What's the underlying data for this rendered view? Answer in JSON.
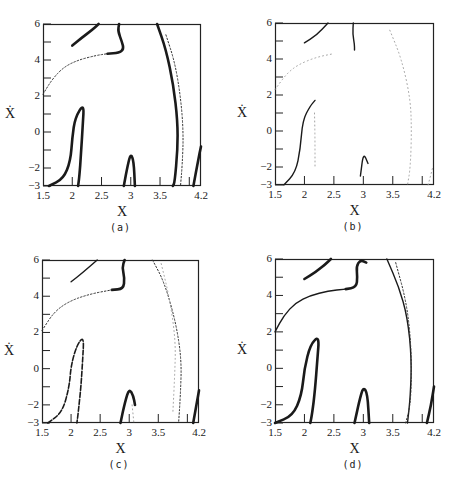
{
  "chart_data": [
    {
      "type": "scatter",
      "panel": "a",
      "caption": "(a)",
      "xlabel": "X",
      "ylabel": "Ẋ",
      "xlim": [
        1.5,
        4.2
      ],
      "ylim": [
        -3,
        6
      ],
      "xticks": [
        "1.5",
        "2",
        "2.5",
        "3",
        "3.5",
        "4.2"
      ],
      "yticks": [
        "6",
        "4",
        "2",
        "0",
        "−2",
        "−3"
      ],
      "grid": false,
      "series": [
        {
          "name": "upper-left branch",
          "style": "thick",
          "points": [
            [
              2.0,
              4.8
            ],
            [
              2.15,
              5.2
            ],
            [
              2.35,
              5.7
            ],
            [
              2.45,
              6.0
            ]
          ]
        },
        {
          "name": "upper hook",
          "style": "thick",
          "points": [
            [
              2.8,
              6.0
            ],
            [
              2.78,
              5.6
            ],
            [
              2.85,
              5.0
            ],
            [
              2.88,
              4.6
            ],
            [
              2.8,
              4.4
            ],
            [
              2.6,
              4.35
            ]
          ]
        },
        {
          "name": "dotted arc",
          "style": "dotted",
          "points": [
            [
              1.5,
              2.1
            ],
            [
              1.65,
              2.9
            ],
            [
              1.85,
              3.6
            ],
            [
              2.1,
              4.0
            ],
            [
              2.4,
              4.25
            ],
            [
              2.6,
              4.35
            ]
          ]
        },
        {
          "name": "left tongue",
          "style": "thick",
          "points": [
            [
              1.6,
              -3.0
            ],
            [
              1.85,
              -2.6
            ],
            [
              1.97,
              -1.6
            ],
            [
              2.0,
              -0.3
            ],
            [
              2.05,
              0.8
            ],
            [
              2.2,
              1.6
            ],
            [
              2.18,
              0.4
            ],
            [
              2.15,
              -1.2
            ],
            [
              2.12,
              -2.5
            ],
            [
              2.1,
              -3.0
            ]
          ]
        },
        {
          "name": "middle tongue",
          "style": "thick",
          "points": [
            [
              2.88,
              -3.0
            ],
            [
              2.95,
              -1.8
            ],
            [
              3.0,
              -1.2
            ],
            [
              3.05,
              -1.6
            ],
            [
              3.07,
              -3.0
            ]
          ]
        },
        {
          "name": "outer arc",
          "style": "thick",
          "points": [
            [
              3.45,
              6.0
            ],
            [
              3.6,
              4.6
            ],
            [
              3.73,
              2.6
            ],
            [
              3.8,
              0.6
            ],
            [
              3.8,
              -1.0
            ],
            [
              3.75,
              -2.8
            ],
            [
              3.72,
              -3.0
            ]
          ]
        },
        {
          "name": "inner dotted arc",
          "style": "dotted",
          "points": [
            [
              3.6,
              5.4
            ],
            [
              3.75,
              3.9
            ],
            [
              3.85,
              2.0
            ],
            [
              3.9,
              0.0
            ],
            [
              3.88,
              -1.8
            ],
            [
              3.85,
              -3.0
            ]
          ]
        },
        {
          "name": "right edge",
          "style": "thick",
          "points": [
            [
              4.07,
              -3.0
            ],
            [
              4.15,
              -1.6
            ],
            [
              4.2,
              -0.8
            ]
          ]
        }
      ]
    },
    {
      "type": "scatter",
      "panel": "b",
      "caption": "(b)",
      "xlabel": "X",
      "ylabel": "Ẋ",
      "xlim": [
        1.5,
        4.2
      ],
      "ylim": [
        -3,
        6
      ],
      "xticks": [
        "1.5",
        "2",
        "2.5",
        "3",
        "3.5",
        "4.2"
      ],
      "yticks": [
        "6",
        "4",
        "2",
        "0",
        "−2",
        "−3"
      ],
      "grid": false,
      "series": [
        {
          "name": "upper-left branch",
          "style": "medium",
          "points": [
            [
              2.0,
              4.9
            ],
            [
              2.2,
              5.3
            ],
            [
              2.4,
              6.0
            ]
          ]
        },
        {
          "name": "upper hook",
          "style": "medium",
          "points": [
            [
              2.83,
              6.0
            ],
            [
              2.82,
              5.4
            ],
            [
              2.85,
              4.8
            ],
            [
              2.85,
              4.5
            ]
          ]
        },
        {
          "name": "dotted arc",
          "style": "faint",
          "points": [
            [
              1.5,
              2.3
            ],
            [
              1.7,
              3.2
            ],
            [
              1.9,
              3.7
            ],
            [
              2.2,
              4.1
            ],
            [
              2.5,
              4.3
            ]
          ]
        },
        {
          "name": "left tongue",
          "style": "medium",
          "points": [
            [
              1.65,
              -3.0
            ],
            [
              1.85,
              -2.3
            ],
            [
              1.93,
              -1.0
            ],
            [
              1.97,
              0.6
            ],
            [
              2.1,
              1.4
            ],
            [
              2.18,
              1.7
            ]
          ]
        },
        {
          "name": "left tongue return",
          "style": "faint",
          "points": [
            [
              2.17,
              1.0
            ],
            [
              2.18,
              -0.5
            ],
            [
              2.18,
              -2.0
            ]
          ]
        },
        {
          "name": "middle tongue",
          "style": "medium",
          "points": [
            [
              2.95,
              -2.5
            ],
            [
              3.0,
              -1.2
            ],
            [
              3.08,
              -1.8
            ]
          ]
        },
        {
          "name": "right dotted arc",
          "style": "faint",
          "points": [
            [
              3.45,
              5.6
            ],
            [
              3.65,
              4.0
            ],
            [
              3.8,
              1.8
            ],
            [
              3.82,
              0.0
            ],
            [
              3.8,
              -2.0
            ],
            [
              3.75,
              -3.0
            ]
          ]
        },
        {
          "name": "right edge",
          "style": "faint",
          "points": [
            [
              4.1,
              -3.0
            ],
            [
              4.18,
              -2.0
            ]
          ]
        }
      ]
    },
    {
      "type": "scatter",
      "panel": "c",
      "caption": "(c)",
      "xlabel": "X",
      "ylabel": "Ẋ",
      "xlim": [
        1.5,
        4.2
      ],
      "ylim": [
        -3,
        6
      ],
      "xticks": [
        "1.5",
        "2",
        "2.5",
        "3",
        "3.5",
        "4.2"
      ],
      "yticks": [
        "6",
        "4",
        "2",
        "0",
        "−2",
        "−3"
      ],
      "grid": false,
      "series": [
        {
          "name": "upper-left branch",
          "style": "medium",
          "points": [
            [
              2.0,
              4.8
            ],
            [
              2.2,
              5.3
            ],
            [
              2.45,
              6.0
            ]
          ]
        },
        {
          "name": "upper hook",
          "style": "thick",
          "points": [
            [
              2.92,
              6.0
            ],
            [
              2.88,
              5.6
            ],
            [
              2.92,
              5.0
            ],
            [
              2.9,
              4.4
            ],
            [
              2.7,
              4.35
            ]
          ]
        },
        {
          "name": "dotted arc",
          "style": "dotted",
          "points": [
            [
              1.5,
              2.1
            ],
            [
              1.7,
              3.1
            ],
            [
              1.95,
              3.7
            ],
            [
              2.3,
              4.1
            ],
            [
              2.7,
              4.35
            ]
          ]
        },
        {
          "name": "left tongue",
          "style": "dashed",
          "points": [
            [
              1.6,
              -3.0
            ],
            [
              1.85,
              -2.4
            ],
            [
              1.97,
              -1.0
            ],
            [
              2.0,
              0.2
            ],
            [
              2.1,
              1.3
            ],
            [
              2.22,
              1.8
            ],
            [
              2.2,
              0.5
            ],
            [
              2.17,
              -1.0
            ],
            [
              2.12,
              -2.5
            ],
            [
              2.1,
              -3.0
            ]
          ]
        },
        {
          "name": "middle tongue",
          "style": "thick",
          "points": [
            [
              2.85,
              -3.0
            ],
            [
              2.93,
              -1.8
            ],
            [
              3.0,
              -1.1
            ],
            [
              3.07,
              -1.5
            ],
            [
              3.1,
              -2.0
            ]
          ]
        },
        {
          "name": "middle tongue tail",
          "style": "faint",
          "points": [
            [
              3.05,
              -2.0
            ],
            [
              3.08,
              -3.0
            ]
          ]
        },
        {
          "name": "outer dotted arc",
          "style": "dotted",
          "points": [
            [
              3.4,
              6.0
            ],
            [
              3.6,
              4.8
            ],
            [
              3.8,
              2.6
            ],
            [
              3.9,
              0.5
            ],
            [
              3.88,
              -1.5
            ],
            [
              3.85,
              -3.0
            ]
          ]
        },
        {
          "name": "inner dotted arc",
          "style": "faint",
          "points": [
            [
              3.55,
              5.8
            ],
            [
              3.7,
              3.8
            ],
            [
              3.8,
              1.5
            ],
            [
              3.78,
              -0.5
            ],
            [
              3.75,
              -2.5
            ]
          ]
        },
        {
          "name": "right edge",
          "style": "thick",
          "points": [
            [
              4.1,
              -3.0
            ],
            [
              4.2,
              -1.2
            ]
          ]
        }
      ]
    },
    {
      "type": "scatter",
      "panel": "d",
      "caption": "(d)",
      "xlabel": "X",
      "ylabel": "Ẋ",
      "xlim": [
        1.5,
        4.2
      ],
      "ylim": [
        -3,
        6
      ],
      "xticks": [
        "1.5",
        "2",
        "2.5",
        "3",
        "3.5",
        "4.2"
      ],
      "yticks": [
        "6",
        "4",
        "2",
        "0",
        "−2",
        "−3"
      ],
      "grid": false,
      "series": [
        {
          "name": "upper-left branch",
          "style": "thick",
          "points": [
            [
              2.0,
              4.9
            ],
            [
              2.2,
              5.3
            ],
            [
              2.35,
              5.7
            ],
            [
              2.45,
              6.0
            ]
          ]
        },
        {
          "name": "upper hook",
          "style": "thick",
          "points": [
            [
              3.05,
              5.8
            ],
            [
              2.95,
              5.95
            ],
            [
              2.88,
              5.6
            ],
            [
              2.9,
              5.0
            ],
            [
              2.88,
              4.45
            ],
            [
              2.7,
              4.35
            ]
          ]
        },
        {
          "name": "solid arc",
          "style": "medium",
          "points": [
            [
              1.5,
              2.0
            ],
            [
              1.65,
              2.9
            ],
            [
              1.85,
              3.6
            ],
            [
              2.1,
              4.0
            ],
            [
              2.4,
              4.25
            ],
            [
              2.7,
              4.35
            ]
          ]
        },
        {
          "name": "left tongue",
          "style": "thick",
          "points": [
            [
              1.5,
              -3.0
            ],
            [
              1.8,
              -2.6
            ],
            [
              1.95,
              -1.5
            ],
            [
              2.0,
              0.0
            ],
            [
              2.1,
              1.3
            ],
            [
              2.25,
              1.8
            ],
            [
              2.22,
              0.5
            ],
            [
              2.18,
              -1.2
            ],
            [
              2.13,
              -2.5
            ],
            [
              2.1,
              -3.0
            ]
          ]
        },
        {
          "name": "middle tongue",
          "style": "thick",
          "points": [
            [
              2.85,
              -3.0
            ],
            [
              2.93,
              -1.8
            ],
            [
              3.0,
              -1.0
            ],
            [
              3.07,
              -1.4
            ],
            [
              3.1,
              -3.0
            ]
          ]
        },
        {
          "name": "outer arc",
          "style": "medium",
          "points": [
            [
              3.4,
              6.0
            ],
            [
              3.6,
              4.5
            ],
            [
              3.75,
              2.8
            ],
            [
              3.82,
              0.5
            ],
            [
              3.8,
              -1.5
            ],
            [
              3.75,
              -3.0
            ]
          ]
        },
        {
          "name": "inner dashed arc",
          "style": "dotted",
          "points": [
            [
              3.55,
              5.8
            ],
            [
              3.72,
              3.8
            ],
            [
              3.8,
              1.8
            ],
            [
              3.82,
              -0.2
            ],
            [
              3.8,
              -2.0
            ],
            [
              3.72,
              -3.0
            ]
          ]
        },
        {
          "name": "right edge",
          "style": "thick",
          "points": [
            [
              4.08,
              -3.0
            ],
            [
              4.15,
              -2.0
            ],
            [
              4.2,
              -1.0
            ]
          ]
        }
      ]
    }
  ],
  "panels": [
    {
      "caption": "(a)",
      "xlabel": "X",
      "ylabel": "X",
      "xticks": [
        "1.5",
        "2",
        "2.5",
        "3",
        "3.5",
        "4.2"
      ],
      "yticks": [
        "6",
        "4",
        "2",
        "0",
        "−2",
        "−3"
      ]
    },
    {
      "caption": "(b)",
      "xlabel": "X",
      "ylabel": "X",
      "xticks": [
        "1.5",
        "2",
        "2.5",
        "3",
        "3.5",
        "4.2"
      ],
      "yticks": [
        "6",
        "4",
        "2",
        "0",
        "−2",
        "−3"
      ]
    },
    {
      "caption": "(c)",
      "xlabel": "X",
      "ylabel": "X",
      "xticks": [
        "1.5",
        "2",
        "2.5",
        "3",
        "3.5",
        "4.2"
      ],
      "yticks": [
        "6",
        "4",
        "2",
        "0",
        "−2",
        "−3"
      ]
    },
    {
      "caption": "(d)",
      "xlabel": "X",
      "ylabel": "X",
      "xticks": [
        "1.5",
        "2",
        "2.5",
        "3",
        "3.5",
        "4.2"
      ],
      "yticks": [
        "6",
        "4",
        "2",
        "0",
        "−2",
        "−3"
      ]
    }
  ],
  "colors": {
    "ink": "#1a1a1a",
    "faint": "#9a9a9a",
    "background": "#ffffff"
  }
}
